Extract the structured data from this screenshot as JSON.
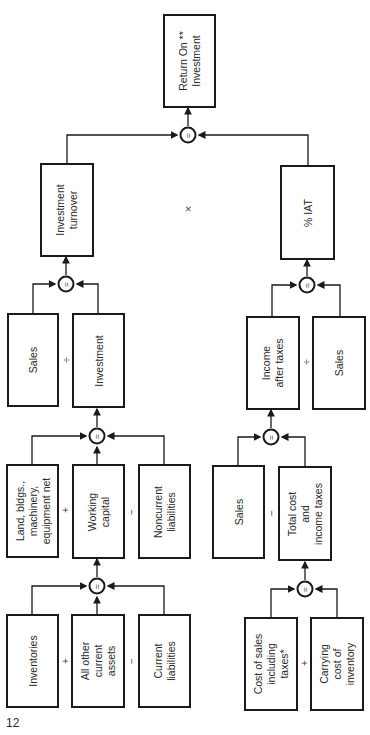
{
  "diagram": {
    "page_number": "12",
    "boxes": {
      "roi": "Return On **\nInvestment",
      "investment_turnover": "Investment\nturnover",
      "pct_iat": "% IAT",
      "sales_1": "Sales",
      "investment": "Investment",
      "income_after_taxes": "Income\nafter taxes",
      "sales_2": "Sales",
      "land": "Land, bldgs.,\nmachinery,\nequipment net",
      "working_capital": "Working\ncapital",
      "noncurrent_liabilities": "Noncurrent\nliabilities",
      "sales_3": "Sales",
      "total_cost": "Total cost\nand\nincome taxes",
      "inventories": "Inventories",
      "other_current_assets": "All other\ncurrent\nassets",
      "current_liabilities": "Current\nliabilities",
      "cost_of_sales": "Cost of sales\nincluding\ntaxes*",
      "carrying_cost": "Carrying\ncost of\ninventory"
    },
    "operators": {
      "multiply": "×",
      "divide_1": "÷",
      "divide_2": "÷",
      "plus_1": "+",
      "minus_1": "−",
      "minus_2": "−",
      "plus_2": "+",
      "minus_3": "−",
      "plus_3": "+",
      "equals": "="
    },
    "colors": {
      "line": "#1a1a1a",
      "background": "#ffffff"
    }
  }
}
